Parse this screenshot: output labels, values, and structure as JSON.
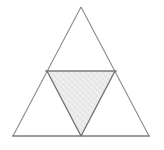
{
  "figure": {
    "name": "subdivided-equilateral-triangle",
    "background_color": "#ffffff",
    "canvas": {
      "width": 164,
      "height": 150
    },
    "style": {
      "outline_color": "#8a8a8a",
      "outline_width": 1.1,
      "midsegment_color": "#7a7a7a",
      "midsegment_width": 1.4,
      "inner_edge_color": "#6e6e6e",
      "inner_edge_width": 1.3,
      "base_edge_color": "#7a7a7a",
      "base_edge_width": 1.6,
      "shade_fill_top": "#f4f4f4",
      "shade_fill_bottom": "#e4e4e4",
      "shade_fill_solid": "#ececec"
    },
    "vertices": {
      "apex": {
        "label": "A",
        "x": 81,
        "y": 7
      },
      "bottom_left": {
        "label": "B",
        "x": 13,
        "y": 136
      },
      "bottom_right": {
        "label": "C",
        "x": 149,
        "y": 136
      },
      "mid_left": {
        "label": "M_AB",
        "x": 47,
        "y": 71
      },
      "mid_right": {
        "label": "M_AC",
        "x": 115,
        "y": 71
      },
      "mid_bottom": {
        "label": "M_BC",
        "x": 81,
        "y": 136
      }
    },
    "regions": [
      {
        "name": "top-sub-triangle",
        "points": "81,7 47,71 115,71",
        "filled": false,
        "fill": "none"
      },
      {
        "name": "bottom-left-sub-triangle",
        "points": "47,71 13,136 81,136",
        "filled": false,
        "fill": "none"
      },
      {
        "name": "bottom-right-sub-triangle",
        "points": "115,71 81,136 149,136",
        "filled": false,
        "fill": "none"
      },
      {
        "name": "center-inverted-sub-triangle",
        "points": "47,71 115,71 81,136",
        "filled": true,
        "fill": "#ececec"
      }
    ],
    "edges": [
      {
        "name": "outer-left-edge",
        "x1": 81,
        "y1": 7,
        "x2": 13,
        "y2": 136
      },
      {
        "name": "outer-right-edge",
        "x1": 81,
        "y1": 7,
        "x2": 149,
        "y2": 136
      },
      {
        "name": "outer-base-edge",
        "x1": 13,
        "y1": 136,
        "x2": 149,
        "y2": 136
      },
      {
        "name": "midsegment-horizontal",
        "x1": 47,
        "y1": 71,
        "x2": 115,
        "y2": 71
      },
      {
        "name": "midsegment-left-descending",
        "x1": 47,
        "y1": 71,
        "x2": 81,
        "y2": 136
      },
      {
        "name": "midsegment-right-descending",
        "x1": 115,
        "y1": 71,
        "x2": 81,
        "y2": 136
      }
    ]
  }
}
